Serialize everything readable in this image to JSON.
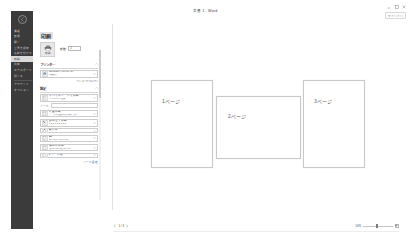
{
  "window": {
    "title": "文書 1 - Word",
    "account_chip": "サインイン",
    "controls": [
      {
        "name": "minimize",
        "glyph": "minimize-icon"
      },
      {
        "name": "restore",
        "glyph": "restore-icon"
      },
      {
        "name": "close",
        "glyph": "close-icon"
      }
    ]
  },
  "backstage": {
    "back_label": "戻る",
    "items": [
      {
        "label": "情報",
        "type": "item",
        "active": false
      },
      {
        "label": "新規",
        "type": "item",
        "active": false
      },
      {
        "label": "開く",
        "type": "item",
        "active": false
      },
      {
        "label": "上書き保存",
        "type": "item",
        "active": false
      },
      {
        "label": "名前を付けて保存",
        "type": "item",
        "active": false
      },
      {
        "label": "印刷",
        "type": "item",
        "active": true
      },
      {
        "label": "共有",
        "type": "item",
        "active": false
      },
      {
        "label": "エクスポート",
        "type": "item",
        "active": false
      },
      {
        "label": "閉じる",
        "type": "item",
        "active": false
      },
      {
        "label": "",
        "type": "sep",
        "active": false
      },
      {
        "label": "アカウント",
        "type": "item",
        "active": false
      },
      {
        "label": "オプション",
        "type": "item",
        "active": false
      }
    ]
  },
  "print_panel": {
    "heading": "印刷",
    "print_button_label": "印刷",
    "print_icon": "printer-icon",
    "copies_label": "部数:",
    "copies_value": "1",
    "printer_section": {
      "label": "プリンター",
      "expand_icon": "chevron-up-icon",
      "name": "Microsoft Print to PDF",
      "status": "準備完了",
      "icon": "printer-device-icon",
      "properties_link": "プリンターのプロパティ"
    },
    "settings_section": {
      "label": "設定",
      "expand_icon": "chevron-up-icon",
      "rows": [
        {
          "icon": "document-range-icon",
          "title": "すべてのページを印刷",
          "subtitle": "ドキュメント全体",
          "caret": "chevron-down-icon"
        },
        {
          "type": "field",
          "label": "ページ:",
          "value": ""
        },
        {
          "icon": "one-sided-icon",
          "title": "片面印刷",
          "subtitle": "ページの片面のみを印刷します",
          "caret": "chevron-down-icon"
        },
        {
          "icon": "collate-icon",
          "title": "部単位で印刷",
          "subtitle": "1,2,3   1,2,3   1,2,3",
          "caret": "chevron-down-icon"
        },
        {
          "icon": "orientation-icon",
          "title": "縦方向",
          "subtitle": "",
          "caret": "chevron-down-icon"
        },
        {
          "icon": "paper-size-icon",
          "title": "A4",
          "subtitle": "210 mm x 297 mm",
          "caret": "chevron-down-icon"
        },
        {
          "icon": "margins-icon",
          "title": "標準の余白",
          "subtitle": "左: 30 mm   右: 30 mm",
          "caret": "chevron-down-icon"
        },
        {
          "icon": "pages-per-sheet-icon",
          "title": "1 ページ/枚",
          "subtitle": "",
          "caret": "chevron-down-icon"
        }
      ],
      "page_setup_link": "ページ設定"
    }
  },
  "preview": {
    "pages": [
      {
        "label": "1ページ",
        "orientation": "portrait"
      },
      {
        "label": "2ページ",
        "orientation": "landscape"
      },
      {
        "label": "3ページ",
        "orientation": "portrait"
      }
    ]
  },
  "status": {
    "prev_icon": "chevron-left-icon",
    "next_icon": "chevron-right-icon",
    "page_count": "1 / 3",
    "zoom_percent": "54%",
    "zoom_out_glyph": "−",
    "zoom_in_glyph": "+",
    "fit_page_icon": "fit-page-icon"
  }
}
